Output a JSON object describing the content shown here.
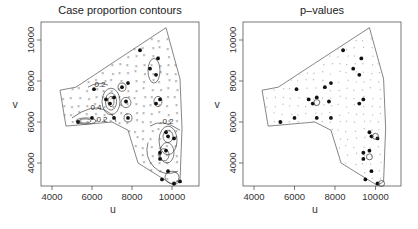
{
  "chart_data": [
    {
      "type": "scatter",
      "title": "Case proportion contours",
      "xlabel": "u",
      "ylabel": "v",
      "xlim": [
        3500,
        11500
      ],
      "ylim": [
        2800,
        10800
      ],
      "xticks": [
        "4000",
        "6000",
        "8000",
        "10000"
      ],
      "yticks": [
        "4000",
        "6000",
        "8000",
        "10000"
      ],
      "xtick_values": [
        4000,
        6000,
        8000,
        10000
      ],
      "ytick_values": [
        4000,
        6000,
        8000,
        10000
      ],
      "contour_labels": [
        {
          "label": "0.2",
          "u": 6400,
          "v": 7700
        },
        {
          "label": "0.4",
          "u": 6200,
          "v": 6600
        },
        {
          "label": "0.2",
          "u": 6500,
          "v": 6000
        },
        {
          "label": "0.2",
          "u": 9800,
          "v": 5900
        }
      ],
      "boundary": [
        [
          4400,
          7550
        ],
        [
          5200,
          7700
        ],
        [
          6900,
          8800
        ],
        [
          9700,
          10600
        ],
        [
          10400,
          8100
        ],
        [
          10500,
          5700
        ],
        [
          10400,
          3100
        ],
        [
          10100,
          2900
        ],
        [
          8300,
          4000
        ],
        [
          7800,
          5600
        ],
        [
          7000,
          6000
        ],
        [
          4700,
          5800
        ]
      ],
      "cases": [
        [
          8400,
          9500
        ],
        [
          9300,
          9100
        ],
        [
          8900,
          8600
        ],
        [
          9200,
          8300
        ],
        [
          6100,
          7600
        ],
        [
          7500,
          7700
        ],
        [
          7800,
          7900
        ],
        [
          6700,
          7100
        ],
        [
          7100,
          7200
        ],
        [
          6900,
          6900
        ],
        [
          7700,
          7000
        ],
        [
          9200,
          6900
        ],
        [
          9400,
          7100
        ],
        [
          6000,
          6200
        ],
        [
          7100,
          6200
        ],
        [
          7800,
          6200
        ],
        [
          5300,
          6000
        ],
        [
          9700,
          5500
        ],
        [
          9800,
          5300
        ],
        [
          10100,
          5200
        ],
        [
          9400,
          4500
        ],
        [
          9700,
          4600
        ],
        [
          9400,
          4200
        ],
        [
          9800,
          3600
        ],
        [
          9500,
          3200
        ],
        [
          10100,
          3000
        ],
        [
          10400,
          3100
        ]
      ]
    },
    {
      "type": "scatter",
      "title": "p–values",
      "xlabel": "u",
      "ylabel": "v",
      "xlim": [
        3500,
        11500
      ],
      "ylim": [
        2800,
        10800
      ],
      "xticks": [
        "4000",
        "6000",
        "8000",
        "10000"
      ],
      "yticks": [
        "4000",
        "6000",
        "8000",
        "10000"
      ],
      "xtick_values": [
        4000,
        6000,
        8000,
        10000
      ],
      "ytick_values": [
        4000,
        6000,
        8000,
        10000
      ],
      "boundary": [
        [
          4400,
          7550
        ],
        [
          5200,
          7700
        ],
        [
          6900,
          8800
        ],
        [
          9700,
          10600
        ],
        [
          10400,
          8100
        ],
        [
          10500,
          5700
        ],
        [
          10400,
          3100
        ],
        [
          10100,
          2900
        ],
        [
          8300,
          4000
        ],
        [
          7800,
          5600
        ],
        [
          7000,
          6000
        ],
        [
          4700,
          5800
        ]
      ],
      "cases": [
        [
          8400,
          9500
        ],
        [
          9300,
          9100
        ],
        [
          8900,
          8600
        ],
        [
          9200,
          8300
        ],
        [
          6100,
          7600
        ],
        [
          7500,
          7700
        ],
        [
          7800,
          7900
        ],
        [
          6700,
          7100
        ],
        [
          7100,
          7200
        ],
        [
          6900,
          6900
        ],
        [
          7700,
          7000
        ],
        [
          9200,
          6900
        ],
        [
          9400,
          7100
        ],
        [
          6000,
          6200
        ],
        [
          7100,
          6200
        ],
        [
          7800,
          6200
        ],
        [
          5300,
          6000
        ],
        [
          9700,
          5500
        ],
        [
          9800,
          5300
        ],
        [
          10100,
          5200
        ],
        [
          9400,
          4500
        ],
        [
          9700,
          4600
        ],
        [
          9400,
          4200
        ],
        [
          9800,
          3600
        ],
        [
          9500,
          3200
        ],
        [
          10100,
          3000
        ]
      ],
      "significant_circles": [
        [
          7100,
          6950
        ],
        [
          10000,
          5300
        ],
        [
          9700,
          4300
        ],
        [
          10300,
          3000
        ]
      ]
    }
  ]
}
